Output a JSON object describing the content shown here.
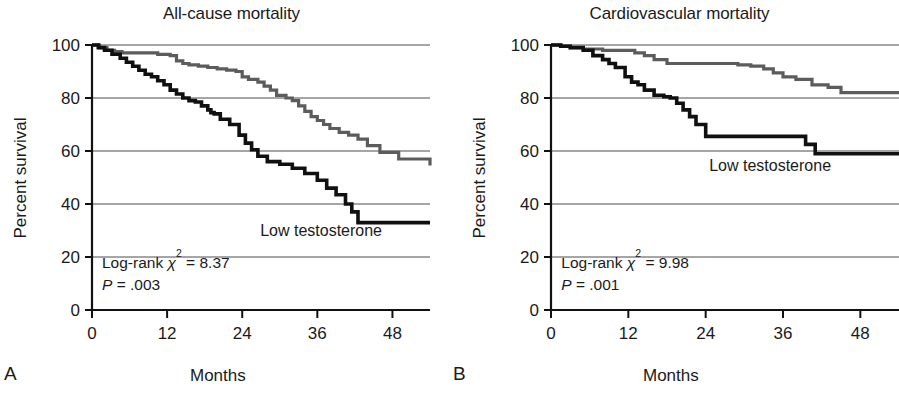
{
  "figure": {
    "background_color": "#ffffff",
    "panels": [
      {
        "letter": "A",
        "title": "All-cause mortality",
        "xlabel": "Months",
        "ylabel": "Percent survival",
        "curve_label": "Low testosterone",
        "stat_line1_prefix": "Log-rank ",
        "stat_line1_chi": "χ",
        "stat_line1_sup": "2",
        "stat_line1_value": " = 8.37",
        "stat_line2_italic": "P",
        "stat_line2_value": " = .003"
      },
      {
        "letter": "B",
        "title": "Cardiovascular mortality",
        "xlabel": "Months",
        "ylabel": "Percent survival",
        "curve_label": "Low testosterone",
        "stat_line1_prefix": "Log-rank ",
        "stat_line1_chi": "χ",
        "stat_line1_sup": "2",
        "stat_line1_value": " = 9.98",
        "stat_line2_italic": "P",
        "stat_line2_value": " = .001"
      }
    ]
  },
  "chart_data": [
    {
      "type": "line",
      "subtype": "kaplan-meier-step",
      "panel": "A",
      "title": "All-cause mortality",
      "xlabel": "Months",
      "ylabel": "Percent survival",
      "xlim": [
        0,
        54
      ],
      "ylim": [
        0,
        100
      ],
      "xticks": [
        0,
        12,
        24,
        36,
        48
      ],
      "yticks": [
        0,
        20,
        40,
        60,
        80,
        100
      ],
      "xticklabels": [
        "0",
        "12",
        "24",
        "36",
        "48"
      ],
      "yticklabels": [
        "0",
        "20",
        "40",
        "60",
        "80",
        "100"
      ],
      "grid": "horizontal",
      "legend_position": "inline-annotation",
      "annotations": [
        {
          "text": "Low testosterone",
          "x": 36.5,
          "y": 28
        },
        {
          "text": "Log-rank χ² = 8.37",
          "x": 1.5,
          "y": 15
        },
        {
          "text": "P = .003",
          "x": 1.5,
          "y": 7
        }
      ],
      "series": [
        {
          "name": "Normal testosterone",
          "color": "#5c5c5c",
          "style": "step-post",
          "x": [
            0,
            1.2,
            2.4,
            3.6,
            4.8,
            9.0,
            10.5,
            12.5,
            13.5,
            14.5,
            15.5,
            17.0,
            18.5,
            20.0,
            21.5,
            23.0,
            24.0,
            25.0,
            26.5,
            27.5,
            28.5,
            29.5,
            31.0,
            32.0,
            33.0,
            34.0,
            35.0,
            36.0,
            37.0,
            38.0,
            39.5,
            41.0,
            42.5,
            44.0,
            46.0,
            49.0,
            54.0
          ],
          "y": [
            100,
            99,
            98,
            97.5,
            97,
            97,
            96.5,
            96,
            94,
            93,
            92.5,
            92,
            91.5,
            91,
            90.5,
            90,
            88,
            87,
            86,
            84.5,
            83,
            81,
            80,
            79,
            77,
            75,
            73,
            71.5,
            70,
            68.5,
            67,
            66,
            64.5,
            62,
            59.5,
            57,
            54.5
          ]
        },
        {
          "name": "Low testosterone",
          "color": "#101010",
          "style": "step-post",
          "x": [
            0,
            1.0,
            2.0,
            3.2,
            4.5,
            5.5,
            6.5,
            7.5,
            8.5,
            9.5,
            10.5,
            11.5,
            12.5,
            13.5,
            14.5,
            15.5,
            16.5,
            17.5,
            18.5,
            19.0,
            19.5,
            20.5,
            22.0,
            23.5,
            24.5,
            25.5,
            26.5,
            28.0,
            30.0,
            32.0,
            34.0,
            36.0,
            37.5,
            39.0,
            40.5,
            41.5,
            42.5,
            54.0
          ],
          "y": [
            100,
            99,
            98,
            96.5,
            95,
            93.5,
            92,
            90.5,
            89,
            88,
            86.5,
            85,
            83,
            81.5,
            80,
            79,
            78.5,
            77,
            75.5,
            74.5,
            74,
            72,
            70,
            66,
            63,
            60.5,
            58,
            56,
            55,
            53.5,
            51.5,
            49,
            46,
            43.5,
            40,
            37,
            33,
            33
          ]
        }
      ]
    },
    {
      "type": "line",
      "subtype": "kaplan-meier-step",
      "panel": "B",
      "title": "Cardiovascular mortality",
      "xlabel": "Months",
      "ylabel": "Percent survival",
      "xlim": [
        0,
        54
      ],
      "ylim": [
        0,
        100
      ],
      "xticks": [
        0,
        12,
        24,
        36,
        48
      ],
      "yticks": [
        0,
        20,
        40,
        60,
        80,
        100
      ],
      "xticklabels": [
        "0",
        "12",
        "24",
        "36",
        "48"
      ],
      "yticklabels": [
        "0",
        "20",
        "40",
        "60",
        "80",
        "100"
      ],
      "grid": "horizontal",
      "legend_position": "inline-annotation",
      "annotations": [
        {
          "text": "Low testosterone",
          "x": 34.5,
          "y": 53
        },
        {
          "text": "Log-rank χ² = 9.98",
          "x": 1.5,
          "y": 15
        },
        {
          "text": "P = .001",
          "x": 1.5,
          "y": 7
        }
      ],
      "series": [
        {
          "name": "Normal testosterone",
          "color": "#5c5c5c",
          "style": "step-post",
          "x": [
            0,
            1.5,
            3.0,
            5.0,
            8.0,
            11.5,
            13.0,
            14.5,
            16.0,
            18.0,
            22.0,
            26.0,
            29.0,
            31.0,
            33.0,
            34.5,
            36.0,
            38.0,
            40.5,
            43.0,
            45.0,
            54.0
          ],
          "y": [
            100,
            99.5,
            99,
            98.5,
            98,
            98,
            97,
            96,
            94.5,
            93,
            93,
            93,
            92.5,
            92,
            91,
            89.5,
            88,
            87,
            85,
            84,
            82,
            82
          ]
        },
        {
          "name": "Low testosterone",
          "color": "#101010",
          "style": "step-post",
          "x": [
            0,
            1.5,
            3.0,
            5.0,
            6.5,
            8.0,
            9.0,
            10.0,
            11.5,
            12.5,
            13.5,
            14.5,
            16.0,
            17.5,
            18.5,
            19.5,
            20.5,
            21.5,
            22.5,
            24.0,
            38.0,
            39.5,
            41.0,
            54.0
          ],
          "y": [
            100,
            99.5,
            99,
            98,
            96,
            94.5,
            93,
            91.5,
            88,
            86,
            85,
            83,
            81,
            80.5,
            80,
            78,
            75.5,
            73,
            70,
            65.5,
            65.5,
            62.5,
            59,
            59
          ]
        }
      ]
    }
  ]
}
